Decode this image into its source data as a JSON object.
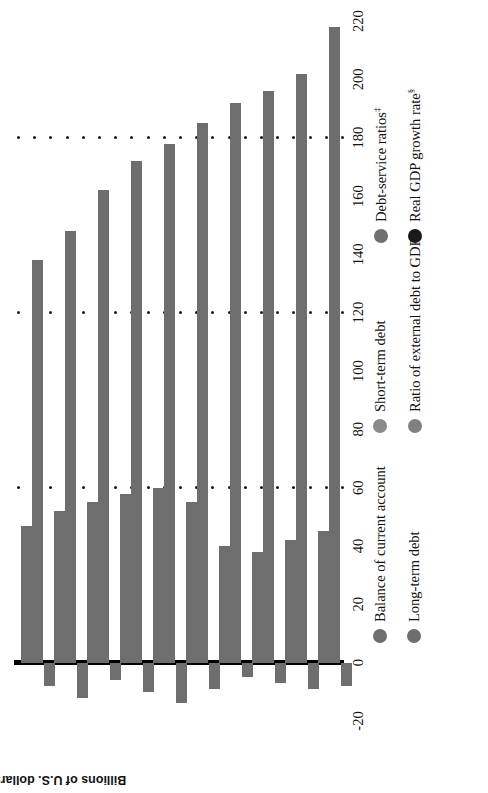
{
  "chart_data": {
    "type": "bar",
    "orientation": "horizontal-stacked",
    "title": "",
    "xlabel": "",
    "ylabel": "Billions of U.S. dollars",
    "ylim": [
      -20,
      220
    ],
    "yticks": [
      -20,
      0,
      20,
      40,
      60,
      80,
      100,
      120,
      140,
      160,
      180,
      200,
      220
    ],
    "ytick_labels": [
      "-20",
      "0",
      "20",
      "40",
      "60",
      "80",
      "100",
      "120",
      "140",
      "160",
      "180",
      "200",
      "220"
    ],
    "categories": [
      "1992",
      "1993",
      "1994",
      "1995",
      "1996",
      "1997",
      "1998",
      "1999",
      "2000",
      "2001"
    ],
    "grid": "dotted",
    "legend_position": "bottom",
    "series": [
      {
        "name": "Long-term debt",
        "color": "#6e6e6e",
        "values": [
          138,
          148,
          162,
          172,
          178,
          185,
          192,
          196,
          202,
          218
        ]
      },
      {
        "name": "Short-term debt",
        "color": "#6e6e6e",
        "values": [
          47,
          52,
          55,
          58,
          60,
          55,
          40,
          38,
          42,
          45
        ]
      },
      {
        "name": "Balance of current account",
        "color": "#6e6e6e",
        "values": [
          -8,
          -12,
          -6,
          -10,
          -14,
          -9,
          -5,
          -7,
          -9,
          -8
        ]
      }
    ],
    "marker_only_series": [
      {
        "name": "Ratio of external debt to GDP",
        "symbol": "†",
        "color": "#808080"
      },
      {
        "name": "Debt-service ratios",
        "symbol": "‡",
        "color": "#707070"
      },
      {
        "name": "Real GDP growth rate",
        "symbol": "§",
        "color": "#1a1a1a"
      }
    ]
  },
  "axis": {
    "y_title": "Billions of U.S. dollars"
  },
  "legend": {
    "items": [
      {
        "label": "Balance of current account",
        "color": "#6e6e6e",
        "sup": ""
      },
      {
        "label": "Long-term debt",
        "color": "#6e6e6e",
        "sup": ""
      },
      {
        "label": "Short-term debt",
        "color": "#8a8a8a",
        "sup": ""
      },
      {
        "label": "Ratio of external debt to GDP",
        "color": "#808080",
        "sup": "†"
      },
      {
        "label": "Debt-service ratios",
        "color": "#707070",
        "sup": "‡"
      },
      {
        "label": "Real GDP growth rate",
        "color": "#1a1a1a",
        "sup": "§"
      }
    ]
  }
}
